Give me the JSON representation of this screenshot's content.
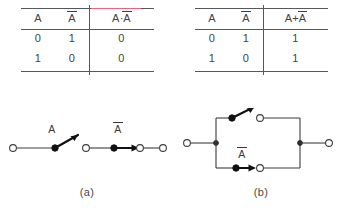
{
  "figure": {
    "panels": [
      {
        "id": "a",
        "caption": "(a)",
        "table": {
          "headers": {
            "input_a": "A",
            "input_not_a": "A",
            "expression_left": "A",
            "expression_op": "·",
            "expression_right": "A",
            "expression_full": "A · Ā"
          },
          "rows": [
            {
              "a": "0",
              "not_a": "1",
              "result": "0"
            },
            {
              "a": "1",
              "not_a": "0",
              "result": "0"
            }
          ]
        },
        "circuit": {
          "type": "series",
          "switches": [
            {
              "label": "A",
              "overbar": false,
              "state": "open"
            },
            {
              "label": "A",
              "overbar": true,
              "state": "closed"
            }
          ]
        }
      },
      {
        "id": "b",
        "caption": "(b)",
        "table": {
          "headers": {
            "input_a": "A",
            "input_not_a": "A",
            "expression_left": "A",
            "expression_op": "+",
            "expression_right": "A",
            "expression_full": "A + Ā"
          },
          "rows": [
            {
              "a": "0",
              "not_a": "1",
              "result": "1"
            },
            {
              "a": "1",
              "not_a": "0",
              "result": "1"
            }
          ]
        },
        "circuit": {
          "type": "parallel",
          "switches": [
            {
              "label": "A",
              "overbar": false,
              "state": "open"
            },
            {
              "label": "A",
              "overbar": true,
              "state": "closed"
            }
          ]
        }
      }
    ],
    "colors": {
      "rule": "#55595b",
      "highlight": "#e8677e",
      "text": "#434343",
      "wire": "#3d3d3d",
      "lever": "#111111"
    }
  }
}
